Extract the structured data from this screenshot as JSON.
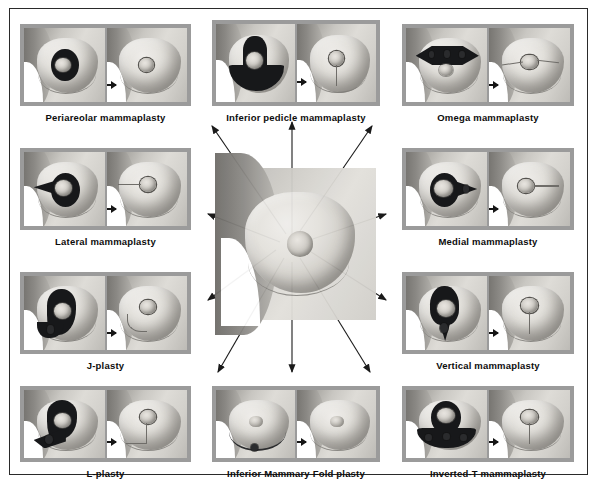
{
  "figure": {
    "type": "medical-diagram",
    "title_visible": false,
    "background_color": "#ffffff",
    "frame_color": "#2a2a2a",
    "panel_border_color": "#9b9b9b",
    "label_color": "#0d0d0d",
    "ink_color": "#17181a",
    "arrow_color": "#1a1a1a"
  },
  "center": {
    "name": "central-breast-diagram",
    "description": "Breast with radiating incision pattern lines",
    "radiating_arrow_count": 10
  },
  "panels": [
    {
      "id": "periareolar",
      "label": "Periareolar mammaplasty",
      "position": "left-column-row-1",
      "before_caption": "resection marking",
      "after_caption": "resulting scar"
    },
    {
      "id": "inferior-pedicle",
      "label": "Inferior pedicle mammaplasty",
      "position": "top-middle",
      "before_caption": "resection marking",
      "after_caption": "resulting scar"
    },
    {
      "id": "omega",
      "label": "Omega mammaplasty",
      "position": "right-column-row-1",
      "before_caption": "resection marking",
      "after_caption": "resulting scar"
    },
    {
      "id": "lateral",
      "label": "Lateral mammaplasty",
      "position": "left-column-row-2",
      "before_caption": "resection marking",
      "after_caption": "resulting scar"
    },
    {
      "id": "medial",
      "label": "Medial mammaplasty",
      "position": "right-column-row-2",
      "before_caption": "resection marking",
      "after_caption": "resulting scar"
    },
    {
      "id": "j-plasty",
      "label": "J-plasty",
      "position": "left-column-row-3",
      "before_caption": "resection marking",
      "after_caption": "resulting scar"
    },
    {
      "id": "vertical",
      "label": "Vertical mammaplasty",
      "position": "right-column-row-3",
      "before_caption": "resection marking",
      "after_caption": "resulting scar"
    },
    {
      "id": "l-plasty",
      "label": "L-plasty",
      "position": "bottom-left",
      "before_caption": "resection marking",
      "after_caption": "resulting scar"
    },
    {
      "id": "inferior-mammary-fold",
      "label": "Inferior Mammary Fold plasty",
      "position": "bottom-middle",
      "before_caption": "resection marking",
      "after_caption": "resulting scar"
    },
    {
      "id": "inverted-t",
      "label": "Inverted-T mammaplasty",
      "position": "bottom-right",
      "before_caption": "resection marking",
      "after_caption": "resulting scar"
    }
  ]
}
